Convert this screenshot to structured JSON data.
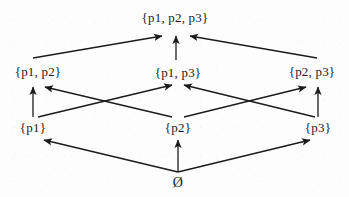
{
  "figure": {
    "kind": "hasse-diagram",
    "width": 349,
    "height": 197,
    "background_color": "#fdfdfd",
    "line_color": "#1b1b1b",
    "text_color": "#1b1b1b"
  },
  "nodes": [
    {
      "id": "top",
      "label": "{p1, p2, p3}",
      "x": 175,
      "y": 18,
      "level": 3
    },
    {
      "id": "p1p2",
      "label": "{p1, p2}",
      "x": 38,
      "y": 72,
      "level": 2
    },
    {
      "id": "p1p3",
      "label": "{p1, p3}",
      "x": 178,
      "y": 73,
      "level": 2
    },
    {
      "id": "p2p3",
      "label": "{p2, p3}",
      "x": 312,
      "y": 72,
      "level": 2
    },
    {
      "id": "p1",
      "label": "{p1}",
      "x": 33,
      "y": 128,
      "level": 1
    },
    {
      "id": "p2",
      "label": "{p2}",
      "x": 178,
      "y": 128,
      "level": 1
    },
    {
      "id": "p3",
      "label": "{p3}",
      "x": 318,
      "y": 128,
      "level": 1
    },
    {
      "id": "empty",
      "label": "Ø",
      "x": 178,
      "y": 183,
      "level": 0
    }
  ],
  "edges": [
    {
      "from": "p1p2",
      "to": "top",
      "name": "edge-p1p2-to-top"
    },
    {
      "from": "p1p3",
      "to": "top",
      "name": "edge-p1p3-to-top"
    },
    {
      "from": "p2p3",
      "to": "top",
      "name": "edge-p2p3-to-top"
    },
    {
      "from": "p1",
      "to": "p1p2",
      "name": "edge-p1-to-p1p2"
    },
    {
      "from": "p2",
      "to": "p1p2",
      "name": "edge-p2-to-p1p2"
    },
    {
      "from": "p1",
      "to": "p1p3",
      "name": "edge-p1-to-p1p3"
    },
    {
      "from": "p3",
      "to": "p1p3",
      "name": "edge-p3-to-p1p3"
    },
    {
      "from": "p2",
      "to": "p2p3",
      "name": "edge-p2-to-p2p3"
    },
    {
      "from": "p3",
      "to": "p2p3",
      "name": "edge-p3-to-p2p3"
    },
    {
      "from": "empty",
      "to": "p1",
      "name": "edge-empty-to-p1"
    },
    {
      "from": "empty",
      "to": "p2",
      "name": "edge-empty-to-p2"
    },
    {
      "from": "empty",
      "to": "p3",
      "name": "edge-empty-to-p3"
    }
  ]
}
